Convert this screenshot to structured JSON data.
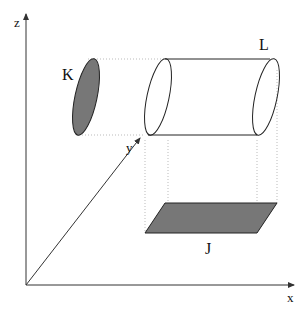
{
  "diagram": {
    "axes": {
      "z_label": "z",
      "y_label": "y",
      "x_label": "x"
    },
    "shapes": {
      "k_label": "K",
      "l_label": "L",
      "j_label": "J"
    },
    "colors": {
      "fill": "#777777",
      "stroke": "#222222",
      "axis": "#333333",
      "dotted": "#bbbbbb"
    }
  }
}
